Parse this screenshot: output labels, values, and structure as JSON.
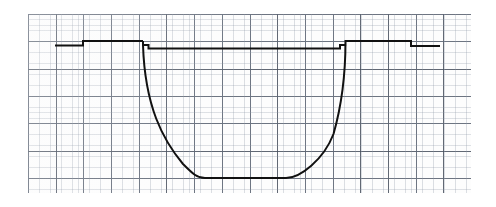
{
  "figure": {
    "title": "",
    "caption": "",
    "background_color": "#ffffff",
    "paper_color": "#fdfdfd",
    "grid_major_color": "#464e5c",
    "grid_minor_color": "#8c96a5",
    "trace_color": "#111111",
    "trace_width_px": 2.0
  },
  "chart_data": {
    "type": "line",
    "title": "",
    "subtitle": "",
    "xlabel": "",
    "ylabel": "",
    "xlim": [
      0,
      16
    ],
    "ylim": [
      0,
      6.55
    ],
    "grid": true,
    "grid_major_divisions_x": 16,
    "grid_major_divisions_y": 6,
    "grid_minor_per_major": 5,
    "legend": [],
    "annotations": [],
    "tick_labels_x": [],
    "tick_labels_y": [],
    "series": [
      {
        "name": "trace",
        "description": "stepped baseline, steep rounded excursion to bottom, return to baseline with steps",
        "x": [
          0.98,
          1.99,
          1.99,
          4.15,
          4.15,
          4.33,
          4.33,
          4.48,
          4.48,
          4.62,
          4.72,
          4.85,
          5.0,
          5.2,
          5.45,
          5.8,
          6.2,
          6.6,
          7.0,
          7.4,
          7.8,
          8.2,
          8.6,
          9.0,
          9.4,
          9.8,
          10.2,
          10.5,
          10.75,
          10.95,
          11.1,
          11.2,
          11.28,
          11.28,
          11.45,
          11.45,
          11.62,
          11.62,
          13.82,
          13.82,
          14.85
        ],
        "y": [
          5.41,
          5.41,
          5.56,
          5.56,
          5.42,
          5.42,
          5.29,
          5.29,
          5.2,
          4.7,
          4.3,
          3.9,
          3.5,
          3.0,
          2.5,
          1.95,
          1.45,
          1.1,
          0.86,
          0.72,
          0.66,
          0.65,
          0.65,
          0.66,
          0.72,
          0.86,
          1.1,
          1.45,
          1.95,
          2.6,
          3.4,
          4.3,
          5.2,
          5.29,
          5.29,
          5.42,
          5.42,
          5.56,
          5.56,
          5.41,
          5.41
        ]
      }
    ]
  },
  "trace_geometry": {
    "note": "pixel-space polyline/bezier description of the plotted trace",
    "left_baseline": {
      "start_x": 55,
      "y": 45.5,
      "step_x": 83,
      "step_y": 41.0
    },
    "left_steps": [
      {
        "x": 143.0,
        "from_y": 41.0,
        "to_y": 45.0
      },
      {
        "x": 148.5,
        "from_y": 45.0,
        "to_y": 48.6
      }
    ],
    "plateau": {
      "from_x": 152,
      "to_x": 340,
      "y": 48.6
    },
    "descent": {
      "x_start": 143.0,
      "x_end": 205,
      "y_start": 45.0,
      "y_end": 178.0
    },
    "bottom": {
      "from_x": 205,
      "to_x": 286,
      "y": 178.0
    },
    "ascent": {
      "x_start": 286,
      "x_end": 345.5,
      "y_start": 178.0,
      "y_end": 41.0
    },
    "right_steps": [
      {
        "x": 340.0,
        "from_y": 48.6,
        "to_y": 45.0
      },
      {
        "x": 345.5,
        "from_y": 45.0,
        "to_y": 41.0
      }
    ],
    "right_baseline": {
      "y": 41.0,
      "to_x": 411,
      "step_y": 46.0,
      "end_x": 440
    }
  },
  "grid": {
    "left_px": 28,
    "top_px": 14,
    "width_px": 443,
    "height_px": 179,
    "major_spacing_x_px": 27.7,
    "major_spacing_y_px": 27.35,
    "minor_spacing_x_px": 5.55,
    "minor_spacing_y_px": 5.47
  }
}
